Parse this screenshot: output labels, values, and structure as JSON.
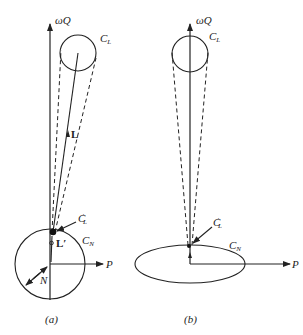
{
  "figure": {
    "panel_a": {
      "caption": "(a)",
      "labels": {
        "axis_vertical": "ωQ",
        "axis_horizontal": "P",
        "circle_top": "C",
        "circle_top_sub": "L",
        "circle_bottom": "C",
        "circle_bottom_sub": "N",
        "point_label": "C",
        "point_label_sub": "L",
        "point_label_prime": "′",
        "vector_L": "L",
        "vector_Lprime": "L′",
        "radius_label": "N"
      }
    },
    "panel_b": {
      "caption": "(b)",
      "labels": {
        "axis_vertical": "ωQ",
        "axis_horizontal": "P",
        "circle_top": "C",
        "circle_top_sub": "L",
        "ellipse": "C",
        "ellipse_sub": "N",
        "point_label": "C",
        "point_label_sub": "L",
        "point_label_prime": "′"
      }
    },
    "colors": {
      "line": "#222222",
      "background": "#ffffff"
    }
  }
}
